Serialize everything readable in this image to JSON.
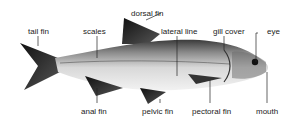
{
  "diagram": {
    "labels": {
      "tail_fin": "tail fin",
      "scales": "scales",
      "dorsal_fin": "dorsal fin",
      "lateral_line": "lateral line",
      "gill_cover": "gill cover",
      "eye": "eye",
      "anal_fin": "anal fin",
      "pelvic_fin": "pelvic fin",
      "pectoral_fin": "pectoral fin",
      "mouth": "mouth"
    }
  }
}
